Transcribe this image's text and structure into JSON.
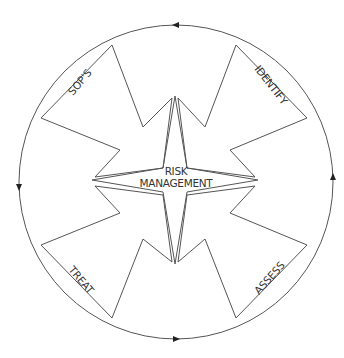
{
  "diagram": {
    "center": {
      "line1": "RISK",
      "line2": "MANAGEMENT"
    },
    "stages": [
      {
        "label": "IDENTIFY",
        "position": "top-right"
      },
      {
        "label": "ASSESS",
        "position": "bottom-right"
      },
      {
        "label": "TREAT",
        "position": "bottom-left"
      },
      {
        "label": "SOP'S",
        "position": "top-left"
      }
    ],
    "cycle_direction": "counter-clockwise arrows on outer circle",
    "colors": {
      "stroke": "#555555",
      "text": "#333333",
      "background": "#ffffff"
    }
  }
}
